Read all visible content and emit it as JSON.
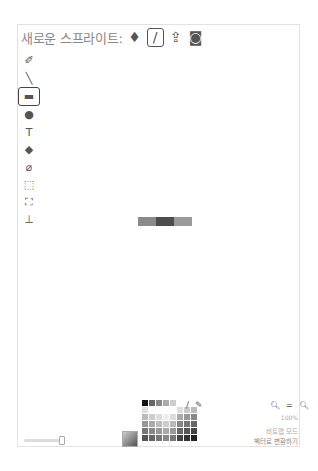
{
  "header": {
    "title": "새로운 스프라이트:",
    "new_sprite_icons": [
      {
        "name": "paint-bucket-library-icon",
        "glyph": "♦",
        "selected": false
      },
      {
        "name": "paintbrush-new-icon",
        "glyph": "/",
        "selected": true
      },
      {
        "name": "upload-icon",
        "glyph": "⇪",
        "selected": false
      },
      {
        "name": "camera-icon",
        "glyph": "◙",
        "selected": false
      }
    ]
  },
  "tools": [
    {
      "name": "brush",
      "glyph": "✐"
    },
    {
      "name": "line",
      "glyph": "╲"
    },
    {
      "name": "rectangle",
      "glyph": "▬",
      "selected": true
    },
    {
      "name": "ellipse",
      "glyph": "●"
    },
    {
      "name": "text",
      "glyph": "T"
    },
    {
      "name": "fill",
      "glyph": "◆"
    },
    {
      "name": "eraser",
      "glyph": "⌀"
    },
    {
      "name": "select",
      "glyph": "⬚"
    },
    {
      "name": "stamp",
      "glyph": "⛶"
    },
    {
      "name": "set-center",
      "glyph": "⊥"
    }
  ],
  "canvas": {
    "strip_colors": [
      "#8a8a8a",
      "#4d4d4d",
      "#9a9a9a"
    ],
    "strip_widths": [
      18,
      18,
      18
    ]
  },
  "palette": {
    "rows": [
      [
        "#111111",
        "#666666",
        "#888888",
        "#aaaaaa",
        "#cccccc",
        "#ffffff",
        "#ffffff",
        "#ffffff"
      ],
      [
        "#dddddd",
        "#ffffff",
        "#ffffff",
        "#ffffff",
        "#ffffff",
        "#dddddd",
        "#cccccc",
        "#bbbbbb"
      ],
      [
        "#bbbbbb",
        "#cccccc",
        "#dddddd",
        "#eeeeee",
        "#dddddd",
        "#aaaaaa",
        "#999999",
        "#888888"
      ],
      [
        "#999999",
        "#aaaaaa",
        "#bbbbbb",
        "#cccccc",
        "#bbbbbb",
        "#888888",
        "#777777",
        "#666666"
      ],
      [
        "#777777",
        "#888888",
        "#999999",
        "#aaaaaa",
        "#999999",
        "#666666",
        "#555555",
        "#444444"
      ],
      [
        "#555555",
        "#666666",
        "#777777",
        "#888888",
        "#777777",
        "#444444",
        "#333333",
        "#222222"
      ]
    ]
  },
  "footer": {
    "zoom_out": "−",
    "zoom_reset": "=",
    "zoom_in": "+",
    "zoom_level": "100%",
    "mode": "비트맵 모드",
    "convert": "벡터로 변환하기"
  }
}
